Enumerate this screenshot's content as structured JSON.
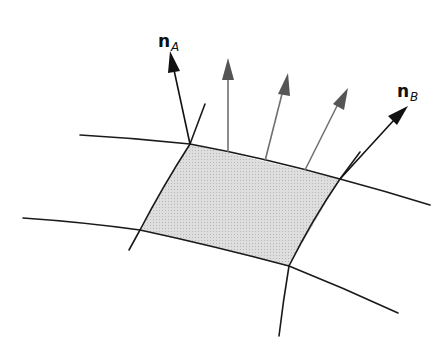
{
  "diagram": {
    "type": "surface-patch-normals",
    "labels": {
      "normal_a": {
        "symbol": "n",
        "subscript": "A"
      },
      "normal_b": {
        "symbol": "n",
        "subscript": "B"
      }
    },
    "colors": {
      "edge": "#1a1a1a",
      "patch_fill": "#d6d6d6",
      "normal_arrow": "#111111",
      "interior_arrow": "#666666"
    },
    "patch": {
      "vertices": [
        [
          190,
          144
        ],
        [
          340,
          179
        ],
        [
          289,
          266
        ],
        [
          140,
          230
        ]
      ]
    },
    "normals": [
      {
        "id": "nA",
        "from": [
          190,
          144
        ],
        "to": [
          170,
          52
        ]
      },
      {
        "id": "nB",
        "from": [
          340,
          179
        ],
        "to": [
          407,
          107
        ]
      }
    ],
    "interior_normals": [
      {
        "from": [
          228,
          152
        ],
        "to": [
          228,
          60
        ]
      },
      {
        "from": [
          265,
          161
        ],
        "to": [
          287,
          75
        ]
      },
      {
        "from": [
          305,
          170
        ],
        "to": [
          347,
          90
        ]
      }
    ]
  }
}
